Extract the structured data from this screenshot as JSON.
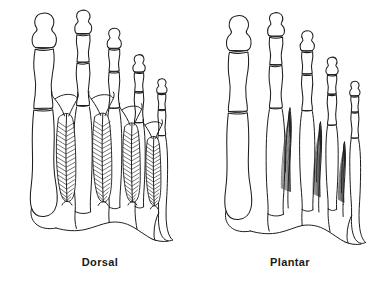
{
  "figure": {
    "background_color": "#ffffff",
    "ink_color": "#1d1d1d",
    "width": 389,
    "height": 299,
    "style": "line drawing / pen-and-ink anatomical illustration",
    "panels": [
      {
        "id": "dorsal",
        "caption": "Dorsal",
        "caption_x": 100,
        "caption_y": 266,
        "view": "dorsal view of right foot skeleton",
        "muscle_name": "dorsal interossei",
        "muscle_count": 4,
        "fiber_architecture": "bipennate",
        "fiber_pattern": "herringbone chevrons converging on a central tendon",
        "toe_count": 5,
        "toes": [
          {
            "name": "hallux",
            "phalanges": 2,
            "label": "1st toe"
          },
          {
            "name": "second toe",
            "phalanges": 3,
            "label": "2nd toe"
          },
          {
            "name": "third toe",
            "phalanges": 3,
            "label": "3rd toe"
          },
          {
            "name": "fourth toe",
            "phalanges": 3,
            "label": "4th toe"
          },
          {
            "name": "fifth toe",
            "phalanges": 3,
            "label": "5th toe"
          }
        ]
      },
      {
        "id": "plantar",
        "caption": "Plantar",
        "caption_x": 290,
        "caption_y": 266,
        "view": "plantar view of right foot skeleton",
        "muscle_name": "plantar interossei",
        "muscle_count": 3,
        "fiber_architecture": "unipennate",
        "fiber_pattern": "parallel fibers fanning from one side of an oblique tendon",
        "toe_count": 5,
        "toes": [
          {
            "name": "hallux",
            "phalanges": 2,
            "label": "1st toe"
          },
          {
            "name": "second toe",
            "phalanges": 3,
            "label": "2nd toe"
          },
          {
            "name": "third toe",
            "phalanges": 3,
            "label": "3rd toe"
          },
          {
            "name": "fourth toe",
            "phalanges": 3,
            "label": "4th toe"
          },
          {
            "name": "fifth toe",
            "phalanges": 3,
            "label": "5th toe"
          }
        ]
      }
    ]
  }
}
